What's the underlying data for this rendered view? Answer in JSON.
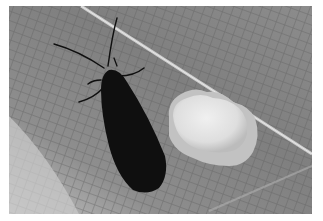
{
  "image": {
    "alt": "Black moth resting on a leaf beside a cluster of white eggs",
    "subjects": [
      {
        "name": "moth",
        "description": "dark black moth with long antennae and slender legs"
      },
      {
        "name": "egg-cluster",
        "description": "white rounded cluster of tiny eggs"
      },
      {
        "name": "leaf",
        "description": "gray leaf surface with fine vein network and a light diagonal midrib"
      }
    ],
    "tone": "grayscale",
    "colors": {
      "leaf_mid": "#858585",
      "leaf_dark": "#6a6a6a",
      "leaf_light": "#b8b8b8",
      "midrib": "#d4d4d4",
      "moth": "#101010",
      "eggs": "#e6e6e6",
      "eggs_shadow": "#bdbdbd",
      "border": "#ffffff"
    }
  }
}
